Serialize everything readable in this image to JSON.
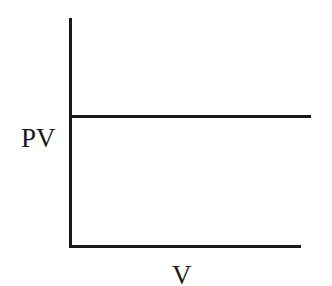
{
  "chart_data": {
    "type": "line",
    "title": "",
    "xlabel": "V",
    "ylabel": "PV",
    "series": [
      {
        "name": "PV vs V",
        "x": [
          0,
          1
        ],
        "values": [
          0.6,
          0.6
        ],
        "description": "horizontal line (PV constant)"
      }
    ],
    "xlim": [
      0,
      1
    ],
    "ylim": [
      0,
      1
    ],
    "grid": false,
    "legend": null,
    "ticks": "none"
  },
  "colors": {
    "axis": "#1a1a1a",
    "line": "#1a1a1a",
    "background": "#ffffff"
  }
}
